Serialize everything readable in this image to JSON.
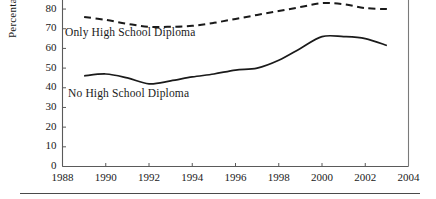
{
  "chart_data": {
    "type": "line",
    "title": "",
    "subtitle": "",
    "xlabel": "",
    "ylabel": "Percentage",
    "xlim": [
      1988,
      2004
    ],
    "ylim": [
      0,
      85
    ],
    "grid": false,
    "legend_position": "inline-annotations",
    "x_ticks": [
      "1988",
      "1990",
      "1992",
      "1994",
      "1996",
      "1998",
      "2000",
      "2002",
      "2004"
    ],
    "y_ticks": [
      "0",
      "10",
      "20",
      "30",
      "40",
      "50",
      "60",
      "70",
      "80"
    ],
    "x": [
      1989,
      1990,
      1991,
      1992,
      1993,
      1994,
      1995,
      1996,
      1997,
      1998,
      1999,
      2000,
      2001,
      2002,
      2003
    ],
    "series": [
      {
        "name": "Some College or More",
        "style": "dotted",
        "color": "#2b2b2b",
        "annotation": "",
        "clipped_above_top": true,
        "values": [
          88,
          87.5,
          87,
          86.5,
          86,
          86.5,
          87,
          88,
          89,
          90,
          91,
          91.5,
          91,
          90.5,
          90
        ]
      },
      {
        "name": "Only High School Diploma",
        "style": "dashed",
        "color": "#1a1a1a",
        "annotation": "Only High School Diploma",
        "values": [
          76,
          74.5,
          72.5,
          71,
          71,
          71.5,
          73,
          75,
          77,
          79,
          81,
          83,
          82.5,
          80.5,
          80
        ]
      },
      {
        "name": "No High School Diploma",
        "style": "solid",
        "color": "#1a1a1a",
        "annotation": "No High School Diploma",
        "values": [
          46,
          47,
          45,
          42,
          43.5,
          45.5,
          47,
          49,
          50,
          54,
          60,
          66,
          66,
          65,
          61.5
        ]
      }
    ]
  },
  "axis": {
    "y_title": "Percentage"
  },
  "annotations": {
    "high_school": "Only High School Diploma",
    "no_high_school": "No High School Diploma"
  }
}
